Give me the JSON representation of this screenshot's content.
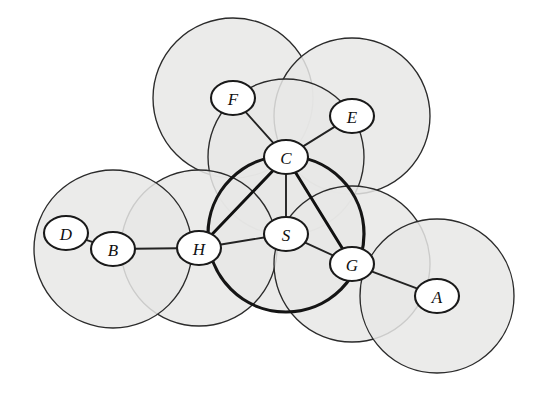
{
  "figure": {
    "kind": "unit-disk-graph-diagram",
    "background_color": "#ffffff",
    "disk_fill_color": "#e8e8e6",
    "stroke_color": "#2b2b2b",
    "emphasis_stroke_color": "#111111",
    "node_fill_color": "#ffffff",
    "node_label_color": "#101010",
    "width": 547,
    "height": 394
  },
  "nodes": [
    {
      "id": "F",
      "label": "F",
      "cx": 233,
      "cy": 98,
      "rx": 22,
      "ry": 17,
      "disk_radius": 80,
      "emphasis": false
    },
    {
      "id": "E",
      "label": "E",
      "cx": 352,
      "cy": 116,
      "rx": 22,
      "ry": 17,
      "disk_radius": 78,
      "emphasis": false
    },
    {
      "id": "C",
      "label": "C",
      "cx": 286,
      "cy": 157,
      "rx": 22,
      "ry": 17,
      "disk_radius": 78,
      "emphasis": false
    },
    {
      "id": "S",
      "label": "S",
      "cx": 286,
      "cy": 234,
      "rx": 22,
      "ry": 17,
      "disk_radius": 78,
      "emphasis": true
    },
    {
      "id": "H",
      "label": "H",
      "cx": 199,
      "cy": 248,
      "rx": 22,
      "ry": 17,
      "disk_radius": 78,
      "emphasis": false
    },
    {
      "id": "B",
      "label": "B",
      "cx": 113,
      "cy": 249,
      "rx": 22,
      "ry": 17,
      "disk_radius": 79,
      "emphasis": false
    },
    {
      "id": "D",
      "label": "D",
      "cx": 66,
      "cy": 233,
      "rx": 22,
      "ry": 17,
      "disk_radius": 0,
      "emphasis": false
    },
    {
      "id": "G",
      "label": "G",
      "cx": 352,
      "cy": 264,
      "rx": 22,
      "ry": 17,
      "disk_radius": 78,
      "emphasis": false
    },
    {
      "id": "A",
      "label": "A",
      "cx": 437,
      "cy": 296,
      "rx": 22,
      "ry": 17,
      "disk_radius": 77,
      "emphasis": false
    }
  ],
  "edges": [
    {
      "from": "D",
      "to": "B",
      "emphasis": false
    },
    {
      "from": "B",
      "to": "H",
      "emphasis": false
    },
    {
      "from": "H",
      "to": "S",
      "emphasis": false
    },
    {
      "from": "H",
      "to": "C",
      "emphasis": true
    },
    {
      "from": "C",
      "to": "S",
      "emphasis": false
    },
    {
      "from": "C",
      "to": "F",
      "emphasis": false
    },
    {
      "from": "C",
      "to": "E",
      "emphasis": false
    },
    {
      "from": "C",
      "to": "G",
      "emphasis": true
    },
    {
      "from": "S",
      "to": "G",
      "emphasis": false
    },
    {
      "from": "G",
      "to": "A",
      "emphasis": false
    }
  ],
  "labels": {
    "A": "A",
    "B": "B",
    "C": "C",
    "D": "D",
    "E": "E",
    "F": "F",
    "G": "G",
    "H": "H",
    "S": "S"
  }
}
